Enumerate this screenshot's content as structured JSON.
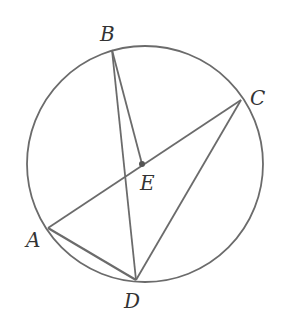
{
  "diagram": {
    "type": "circle-geometry",
    "circle": {
      "cx": 145,
      "cy": 164,
      "r": 118
    },
    "stroke_color": "#6b6b6b",
    "points": {
      "A": {
        "x": 48,
        "y": 228,
        "label": "A",
        "lx": 26,
        "ly": 247
      },
      "B": {
        "x": 112,
        "y": 50,
        "label": "B",
        "lx": 100,
        "ly": 41
      },
      "C": {
        "x": 241,
        "y": 100,
        "label": "C",
        "lx": 250,
        "ly": 105
      },
      "D": {
        "x": 136,
        "y": 280,
        "label": "D",
        "lx": 124,
        "ly": 308
      },
      "E": {
        "x": 142,
        "y": 164,
        "label": "E",
        "lx": 140,
        "ly": 190
      }
    },
    "segments": [
      [
        "A",
        "C"
      ],
      [
        "B",
        "D"
      ],
      [
        "B",
        "E"
      ],
      [
        "A",
        "D"
      ],
      [
        "C",
        "D"
      ]
    ]
  }
}
